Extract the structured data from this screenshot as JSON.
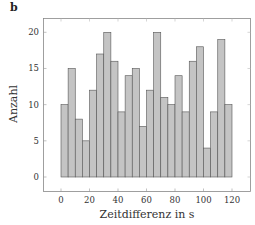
{
  "panel_label": "b",
  "chart_data": {
    "type": "bar",
    "title": "",
    "xlabel": "Zeitdifferenz in s",
    "ylabel": "Anzahl",
    "bin_width": 5,
    "bin_edges_start": 0,
    "categories": [
      "0-5",
      "5-10",
      "10-15",
      "15-20",
      "20-25",
      "25-30",
      "30-35",
      "35-40",
      "40-45",
      "45-50",
      "50-55",
      "55-60",
      "60-65",
      "65-70",
      "70-75",
      "75-80",
      "80-85",
      "85-90",
      "90-95",
      "95-100",
      "100-105",
      "105-110",
      "110-115",
      "115-120"
    ],
    "values": [
      10,
      15,
      8,
      5,
      12,
      17,
      20,
      16,
      9,
      14,
      15,
      7,
      12,
      20,
      11,
      10,
      14,
      9,
      16,
      18,
      4,
      9,
      19,
      10
    ],
    "xticks": [
      0,
      20,
      40,
      60,
      80,
      100,
      120
    ],
    "yticks": [
      0,
      5,
      10,
      15,
      20
    ],
    "xlim": [
      -10,
      130
    ],
    "ylim": [
      -2,
      22
    ],
    "grid": false,
    "legend": null,
    "colors": {
      "bar_fill": "#c4c4c4",
      "bar_edge": "#555555",
      "axis": "#777777"
    }
  }
}
